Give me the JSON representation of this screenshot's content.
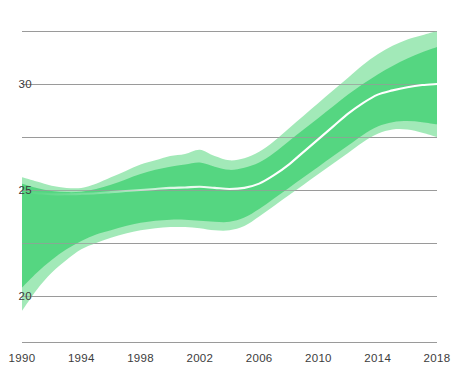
{
  "chart_data": {
    "type": "area",
    "title": "",
    "subtitle": "",
    "xlabel": "",
    "ylabel": "",
    "xlim": [
      1990,
      2018
    ],
    "ylim": [
      17.8,
      32.5
    ],
    "grid": true,
    "grid_y_values": [
      32.5,
      30,
      27.5,
      25,
      22.5,
      20
    ],
    "legend_position": "none",
    "x_tick_labels": [
      "1990",
      "1994",
      "1998",
      "2002",
      "2006",
      "2010",
      "2014",
      "2018"
    ],
    "x_tick_values": [
      1990,
      1994,
      1998,
      2002,
      2006,
      2010,
      2014,
      2018
    ],
    "y_tick_labels": [
      "30",
      "25",
      "20"
    ],
    "y_tick_values": [
      30,
      25,
      20
    ],
    "colors": {
      "band_inner": "#4ED47C",
      "band_outer": "#9DE8B4",
      "median_line": "#ffffff",
      "gridline": "#9a9a9a",
      "axis": "#9a9a9a",
      "tick_text": "#3c3c3c",
      "background": "#ffffff"
    },
    "x": [
      1990,
      1991,
      1992,
      1993,
      1994,
      1995,
      1996,
      1997,
      1998,
      1999,
      2000,
      2001,
      2002,
      2003,
      2004,
      2005,
      2006,
      2007,
      2008,
      2009,
      2010,
      2011,
      2012,
      2013,
      2014,
      2015,
      2016,
      2017,
      2018
    ],
    "series": [
      {
        "name": "outer_upper",
        "role": "outer band upper bound",
        "values": [
          25.6,
          25.4,
          25.2,
          25.1,
          25.1,
          25.3,
          25.6,
          25.9,
          26.2,
          26.4,
          26.6,
          26.7,
          26.9,
          26.6,
          26.4,
          26.5,
          26.8,
          27.3,
          27.9,
          28.5,
          29.1,
          29.7,
          30.3,
          30.9,
          31.4,
          31.8,
          32.1,
          32.3,
          32.5
        ]
      },
      {
        "name": "inner_upper",
        "role": "inner band upper bound",
        "values": [
          25.3,
          25.1,
          24.95,
          24.9,
          24.92,
          25.05,
          25.25,
          25.5,
          25.75,
          25.95,
          26.1,
          26.2,
          26.3,
          26.1,
          25.95,
          26.05,
          26.3,
          26.75,
          27.3,
          27.85,
          28.4,
          28.95,
          29.5,
          30.0,
          30.45,
          30.85,
          31.2,
          31.5,
          31.75
        ]
      },
      {
        "name": "median",
        "role": "central estimate",
        "values": [
          24.9,
          24.85,
          24.8,
          24.8,
          24.82,
          24.85,
          24.9,
          24.95,
          25.0,
          25.05,
          25.1,
          25.12,
          25.15,
          25.1,
          25.05,
          25.1,
          25.3,
          25.7,
          26.2,
          26.8,
          27.4,
          28.0,
          28.6,
          29.1,
          29.5,
          29.7,
          29.85,
          29.95,
          30.0
        ]
      },
      {
        "name": "inner_lower",
        "role": "inner band lower bound",
        "values": [
          20.4,
          21.1,
          21.7,
          22.2,
          22.6,
          22.9,
          23.1,
          23.3,
          23.45,
          23.55,
          23.6,
          23.6,
          23.55,
          23.5,
          23.5,
          23.7,
          24.1,
          24.6,
          25.1,
          25.6,
          26.1,
          26.6,
          27.1,
          27.6,
          28.0,
          28.2,
          28.25,
          28.2,
          28.1
        ]
      },
      {
        "name": "outer_lower",
        "role": "outer band lower bound",
        "values": [
          19.3,
          20.3,
          21.1,
          21.7,
          22.2,
          22.5,
          22.75,
          22.95,
          23.1,
          23.2,
          23.25,
          23.25,
          23.2,
          23.1,
          23.1,
          23.3,
          23.75,
          24.25,
          24.75,
          25.25,
          25.75,
          26.25,
          26.75,
          27.25,
          27.65,
          27.85,
          27.85,
          27.7,
          27.5
        ]
      }
    ]
  }
}
